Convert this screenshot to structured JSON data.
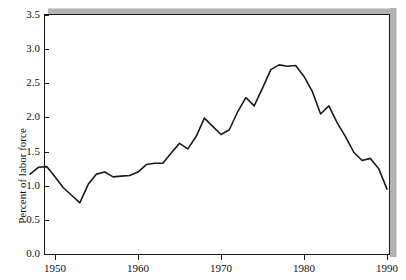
{
  "chart_data": {
    "type": "line",
    "title": "",
    "xlabel": "",
    "ylabel": "Percent of labor force",
    "xlim": [
      1947,
      1990
    ],
    "ylim": [
      0.0,
      3.5
    ],
    "grid": false,
    "legend": null,
    "y_ticks": [
      "0.0",
      "0.5",
      "1.0",
      "1.5",
      "2.0",
      "2.5",
      "3.0",
      "3.5"
    ],
    "y_tick_values": [
      0.0,
      0.5,
      1.0,
      1.5,
      2.0,
      2.5,
      3.0,
      3.5
    ],
    "x_ticks": [
      "1950",
      "1960",
      "1970",
      "1980",
      "1990"
    ],
    "x_tick_values": [
      1950,
      1960,
      1970,
      1980,
      1990
    ],
    "line_color": "#1a1a1a",
    "series": [
      {
        "name": "Percent of labor force",
        "x": [
          1947,
          1948,
          1949,
          1950,
          1951,
          1952,
          1953,
          1954,
          1955,
          1956,
          1957,
          1958,
          1959,
          1960,
          1961,
          1962,
          1963,
          1964,
          1965,
          1966,
          1967,
          1968,
          1969,
          1970,
          1971,
          1972,
          1973,
          1974,
          1975,
          1976,
          1977,
          1978,
          1979,
          1980,
          1981,
          1982,
          1983,
          1984,
          1985,
          1986,
          1987,
          1988,
          1989,
          1990
        ],
        "values": [
          1.17,
          1.27,
          1.28,
          1.13,
          0.97,
          0.86,
          0.75,
          1.02,
          1.17,
          1.2,
          1.13,
          1.14,
          1.15,
          1.2,
          1.31,
          1.33,
          1.33,
          1.48,
          1.62,
          1.54,
          1.72,
          1.99,
          1.87,
          1.75,
          1.82,
          2.08,
          2.29,
          2.17,
          2.43,
          2.7,
          2.77,
          2.75,
          2.76,
          2.6,
          2.38,
          2.05,
          2.17,
          1.92,
          1.72,
          1.49,
          1.37,
          1.4,
          1.25,
          0.95
        ]
      }
    ]
  }
}
